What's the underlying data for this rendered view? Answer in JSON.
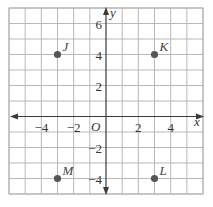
{
  "chart_data": {
    "type": "scatter",
    "title": "",
    "xlabel": "x",
    "ylabel": "y",
    "origin_label": "O",
    "xlim": [
      -6,
      6
    ],
    "ylim": [
      -5,
      7
    ],
    "grid": true,
    "grid_step": 1,
    "x_tick_labels": [
      {
        "value": -4,
        "label": "−4"
      },
      {
        "value": -2,
        "label": "−2"
      },
      {
        "value": 2,
        "label": "2"
      },
      {
        "value": 4,
        "label": "4"
      }
    ],
    "y_tick_labels": [
      {
        "value": 6,
        "label": "6"
      },
      {
        "value": 4,
        "label": "4"
      },
      {
        "value": 2,
        "label": "2"
      },
      {
        "value": -2,
        "label": "−2"
      },
      {
        "value": -4,
        "label": "−4"
      }
    ],
    "points": [
      {
        "name": "J",
        "x": -3,
        "y": 4
      },
      {
        "name": "K",
        "x": 3,
        "y": 4
      },
      {
        "name": "L",
        "x": 3,
        "y": -4
      },
      {
        "name": "M",
        "x": -3,
        "y": -4
      }
    ]
  },
  "style": {
    "point_color": "#555555",
    "grid_color": "#b9b9b9",
    "axis_color": "#3a3a3a"
  }
}
